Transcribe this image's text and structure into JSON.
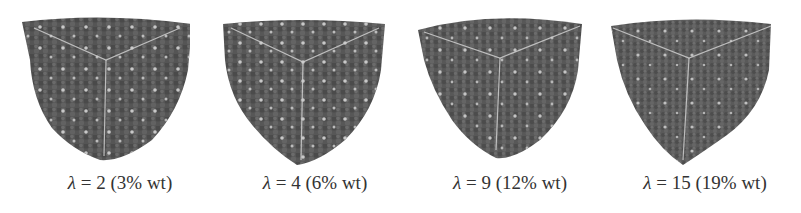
{
  "figure": {
    "panels": [
      {
        "lambda_symbol": "λ",
        "lambda_value": "= 2",
        "wt": "(3% wt)",
        "label": "λ = 2 (3% wt)"
      },
      {
        "lambda_symbol": "λ",
        "lambda_value": "= 4",
        "wt": "(6% wt)",
        "label": "λ = 4 (6% wt)"
      },
      {
        "lambda_symbol": "λ",
        "lambda_value": "= 9",
        "wt": "(12% wt)",
        "label": "λ = 9 (12% wt)"
      },
      {
        "lambda_symbol": "λ",
        "lambda_value": "= 15",
        "wt": "(19% wt)",
        "label": "λ = 15 (19% wt)"
      }
    ],
    "colors": {
      "particle_fill": "#5a5a5a",
      "particle_dark": "#3f3f3f",
      "highlight": "#d8d8d8",
      "edge": "#cfcfcf",
      "caption_text": "#333333"
    }
  }
}
